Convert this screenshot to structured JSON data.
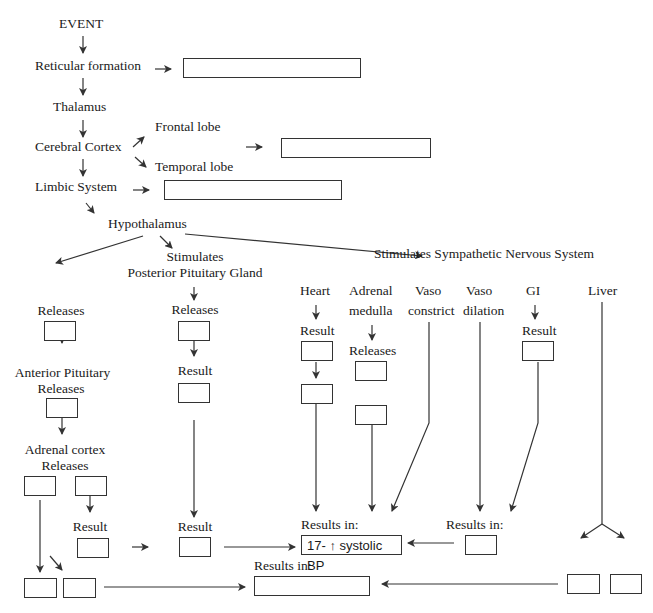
{
  "diagram": {
    "nodes": {
      "event": "EVENT",
      "reticular": "Reticular formation",
      "thalamus": "Thalamus",
      "cortex": "Cerebral Cortex",
      "frontal": "Frontal lobe",
      "temporal": "Temporal lobe",
      "limbic": "Limbic System",
      "hypothalamus": "Hypothalamus",
      "stim_posterior_1": "Stimulates",
      "stim_posterior_2": "Posterior Pituitary Gland",
      "stim_sns": "Stimulates Sympathetic Nervous System",
      "left_releases": "Releases",
      "anterior_1": "Anterior Pituitary",
      "anterior_2": "Releases",
      "adrenal_cortex_1": "Adrenal cortex",
      "adrenal_cortex_2": "Releases",
      "ac_result": "Result",
      "post_releases": "Releases",
      "post_result": "Result",
      "post_result2": "Result",
      "heart": "Heart",
      "heart_result": "Result",
      "adrenal_medulla_1": "Adrenal",
      "adrenal_medulla_2": "medulla",
      "am_releases": "Releases",
      "vaso_c_1": "Vaso",
      "vaso_c_2": "constrict",
      "vaso_d_1": "Vaso",
      "vaso_d_2": "dilation",
      "gi": "GI",
      "gi_result": "Result",
      "liver": "Liver",
      "results_in_center": "Results in:",
      "results_in_right": "Results in:",
      "results_in_bottom": "Results in:"
    },
    "filled_box": "17- ↑ systolic BP",
    "line_color": "#333333"
  }
}
